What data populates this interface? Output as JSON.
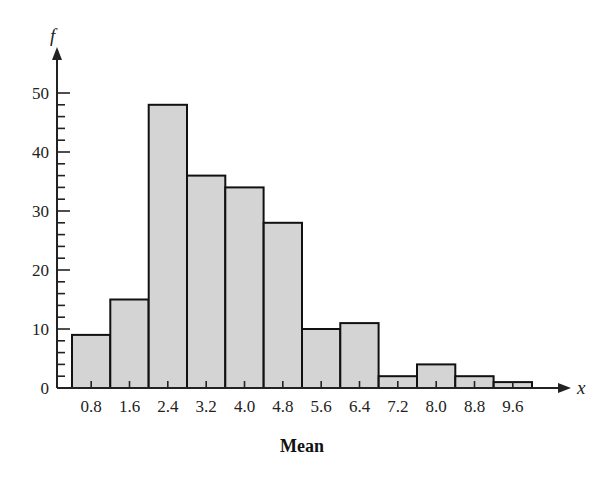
{
  "chart_data": {
    "type": "bar",
    "title": "",
    "xlabel": "Mean",
    "ylabel": "f",
    "x_axis_var": "x",
    "categories": [
      "0.8",
      "1.6",
      "2.4",
      "3.2",
      "4.0",
      "4.8",
      "5.6",
      "6.4",
      "7.2",
      "8.0",
      "8.8",
      "9.6"
    ],
    "values": [
      9,
      15,
      48,
      36,
      34,
      28,
      10,
      11,
      2,
      4,
      2,
      1
    ],
    "ylim": [
      0,
      55
    ],
    "yticks": [
      0,
      10,
      20,
      30,
      40,
      50
    ],
    "yminor_step": 2,
    "grid": false,
    "legend": null,
    "bar_fill": "#d4d4d4",
    "bar_stroke": "#111111",
    "histogram": true
  }
}
